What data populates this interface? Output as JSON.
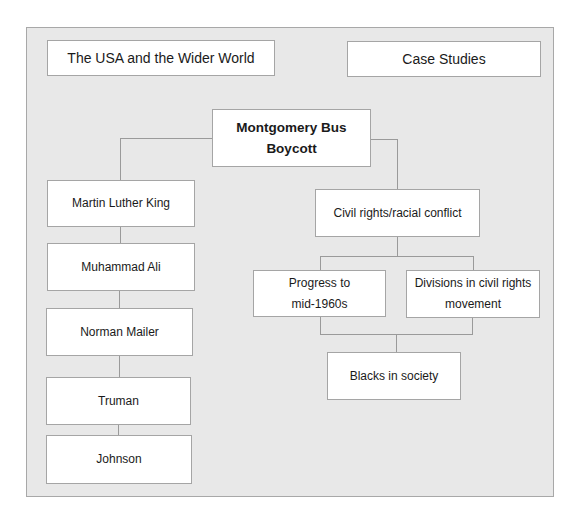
{
  "header": {
    "left_title": "The USA and the Wider World",
    "right_title": "Case Studies"
  },
  "root": {
    "line1": "Montgomery Bus",
    "line2": "Boycott"
  },
  "left_branch": [
    {
      "label": "Martin Luther King"
    },
    {
      "label": "Muhammad Ali"
    },
    {
      "label": "Norman Mailer"
    },
    {
      "label": "Truman"
    },
    {
      "label": "Johnson"
    }
  ],
  "right_branch": {
    "topic": "Civil rights/racial conflict",
    "sub_left": {
      "line1": "Progress to",
      "line2": "mid-1960s"
    },
    "sub_right": {
      "line1": "Divisions in civil rights",
      "line2": "movement"
    },
    "bottom": "Blacks in society"
  },
  "colors": {
    "panel_bg": "#e8e8e8",
    "box_bg": "#ffffff",
    "border": "#a5a5a5",
    "connector": "#9a9a9a"
  }
}
